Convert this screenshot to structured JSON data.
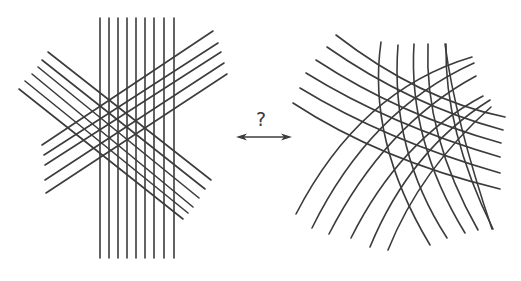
{
  "figure": {
    "label": "?",
    "colors": {
      "line": "#3c3c3c",
      "background": "#ffffff"
    },
    "left_panel": {
      "name": "straight-line-grid",
      "families": [
        {
          "name": "vertical",
          "count": 9,
          "lines": [
            [
              100,
              18,
              100,
              258
            ],
            [
              109,
              18,
              109,
              258
            ],
            [
              118,
              18,
              118,
              258
            ],
            [
              127,
              18,
              127,
              258
            ],
            [
              136,
              18,
              136,
              258
            ],
            [
              145,
              18,
              145,
              258
            ],
            [
              154,
              18,
              154,
              258
            ],
            [
              164,
              18,
              164,
              258
            ],
            [
              174,
              18,
              174,
              258
            ]
          ]
        },
        {
          "name": "descending-diagonal",
          "count": 6,
          "lines": [
            [
              48,
              52,
              211,
              180
            ],
            [
              42,
              60,
              205,
              189
            ],
            [
              38,
              67,
              199,
              198
            ],
            [
              32,
              74,
              193,
              207
            ],
            [
              25,
              81,
              188,
              213
            ],
            [
              19,
              89,
              183,
              219
            ]
          ]
        },
        {
          "name": "ascending-diagonal",
          "count": 5,
          "lines": [
            [
              42,
              145,
              213,
              31
            ],
            [
              44,
              155,
              218,
              43
            ],
            [
              45,
              165,
              221,
              52
            ],
            [
              45,
              180,
              224,
              63
            ],
            [
              46,
              193,
              227,
              74
            ]
          ]
        }
      ]
    },
    "right_panel": {
      "name": "curved-line-grid",
      "families": [
        {
          "name": "near-vertical-arcs",
          "count": 6,
          "paths": [
            "M381,42 Q367,140 430,245",
            "M398,45 Q390,150 447,238",
            "M414,44 Q408,140 465,233",
            "M428,44 Q424,135 478,230",
            "M446,44 Q444,130 493,229",
            "M445,44 Q455,120 492,229"
          ]
        },
        {
          "name": "descending-arcs",
          "count": 6,
          "paths": [
            "M336,35 Q420,100 505,117",
            "M327,47 Q410,105 503,130",
            "M316,60 Q400,115 501,143",
            "M306,73 Q390,125 500,157",
            "M300,88 Q385,140 500,173",
            "M293,103 Q380,160 500,189"
          ]
        },
        {
          "name": "ascending-arcs",
          "count": 6,
          "paths": [
            "M296,214 Q360,90 472,57",
            "M312,228 Q370,110 474,63",
            "M329,234 Q385,125 476,76",
            "M351,238 Q400,140 483,96",
            "M370,247 Q410,150 490,100",
            "M388,250 Q420,170 491,107"
          ]
        }
      ]
    },
    "arrow": {
      "name": "double-headed-arrow",
      "x1": 236,
      "x2": 292,
      "y": 137
    }
  }
}
